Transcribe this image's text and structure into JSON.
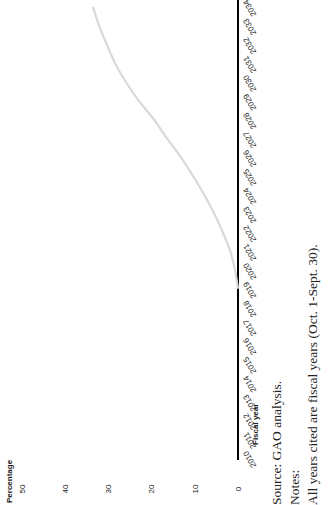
{
  "chart_data": {
    "type": "line",
    "title": "",
    "xlabel": "Fiscal year",
    "ylabel": "Percentage",
    "ylim": [
      0,
      50
    ],
    "yticks": [
      0,
      10,
      20,
      30,
      40,
      50
    ],
    "grid": false,
    "legend": null,
    "orientation_note": "Figure rendered rotated 90 degrees counter-clockwise",
    "categories": [
      "2010",
      "2011",
      "2012",
      "2013",
      "2014",
      "2015",
      "2016",
      "2017",
      "2018",
      "2019",
      "2020",
      "2021",
      "2022",
      "2023",
      "2024",
      "2025",
      "2026",
      "2027",
      "2028",
      "2029",
      "2030",
      "2031",
      "2032",
      "2033",
      "2034"
    ],
    "series": [
      {
        "name": "Percentage",
        "color": "#d9d9d9",
        "values": [
          null,
          null,
          null,
          null,
          null,
          null,
          null,
          null,
          null,
          0,
          0.7,
          1.8,
          3.5,
          5.5,
          7.8,
          10.4,
          13.2,
          16.4,
          19.4,
          22.9,
          25.9,
          28.4,
          30.3,
          32.1,
          33.5
        ]
      }
    ]
  },
  "chart": {
    "ylabel": "Percentage",
    "xlabel": "Fiscal year",
    "yticks": [
      "0",
      "10",
      "20",
      "30",
      "40",
      "50"
    ],
    "xticks": [
      "2010",
      "2011",
      "2012",
      "2013",
      "2014",
      "2015",
      "2016",
      "2017",
      "2018",
      "2019",
      "2020",
      "2021",
      "2022",
      "2023",
      "2024",
      "2025",
      "2026",
      "2027",
      "2028",
      "2029",
      "2030",
      "2031",
      "2032",
      "2033",
      "2034"
    ]
  },
  "notes": {
    "source": "Source: GAO analysis.",
    "notes_label": "Notes:",
    "note_1": "All years cited are fiscal years (Oct. 1-Sept. 30)."
  },
  "colors": {
    "line": "#d9d9d9",
    "axis": "#000000",
    "text": "#222222"
  }
}
